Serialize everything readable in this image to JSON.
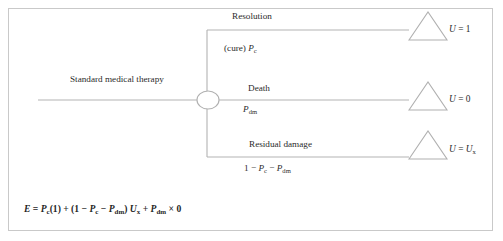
{
  "figure": {
    "type": "decision-tree",
    "border_color": "#c9c9c9",
    "line_color": "#b3b3b3",
    "text_color": "#2b2b2b"
  },
  "root": {
    "label": "Standard medical therapy",
    "node_type": "chance-node"
  },
  "branches": [
    {
      "name": "resolution",
      "label": "Resolution",
      "probability_prefix": "(cure) ",
      "probability_var": "P",
      "probability_sub": "c",
      "terminal_shape": "triangle",
      "utility_lhs": "U",
      "utility_eq": " = ",
      "utility_value": "1",
      "utility_sub": ""
    },
    {
      "name": "death",
      "label": "Death",
      "probability_prefix": "",
      "probability_var": "P",
      "probability_sub": "dm",
      "terminal_shape": "triangle",
      "utility_lhs": "U",
      "utility_eq": " = ",
      "utility_value": "0",
      "utility_sub": ""
    },
    {
      "name": "residual-damage",
      "label": "Residual damage",
      "probability_prefix": "1 − ",
      "probability_var": "P",
      "probability_sub": "c",
      "probability_tail_op": " − ",
      "probability_tail_var": "P",
      "probability_tail_sub": "dm",
      "terminal_shape": "triangle",
      "utility_lhs": "U",
      "utility_eq": " = ",
      "utility_value": "U",
      "utility_sub": "x"
    }
  ],
  "formula": {
    "lhs": "E",
    "eq": " = ",
    "t1_var": "P",
    "t1_sub": "c",
    "t1_tail": "(1) + (1 − ",
    "t2_var": "P",
    "t2_sub": "c",
    "t2_op": " − ",
    "t3_var": "P",
    "t3_sub": "dm",
    "t3_tail": ") ",
    "t4_var": "U",
    "t4_sub": "x",
    "t4_op": " + ",
    "t5_var": "P",
    "t5_sub": "dm",
    "t5_tail": " × 0"
  }
}
